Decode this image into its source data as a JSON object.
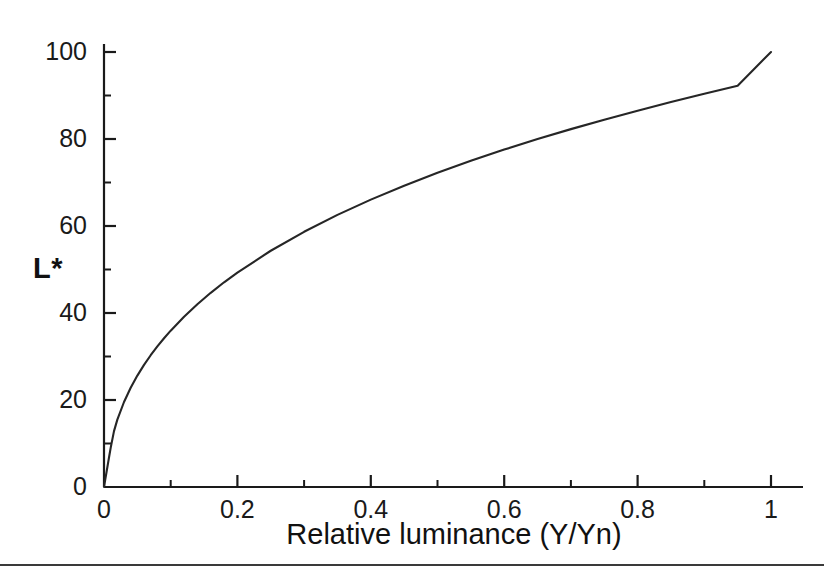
{
  "figure": {
    "background_color": "#ffffff",
    "line_color": "#262626",
    "axis_color": "#1a1a1a",
    "rule_color": "#3a3a3a"
  },
  "chart_data": {
    "type": "line",
    "title": "",
    "subtitle": "",
    "xlabel": "Relative luminance (Y/Yn)",
    "ylabel": "L*",
    "xlim": [
      0,
      1.06
    ],
    "ylim": [
      0,
      103
    ],
    "grid": false,
    "legend": null,
    "x_major_ticks": [
      0,
      0.2,
      0.4,
      0.6,
      0.8,
      1
    ],
    "x_major_tick_labels": [
      "0",
      "0.2",
      "0.4",
      "0.6",
      "0.8",
      "1"
    ],
    "x_minor_ticks": [
      0.1,
      0.3,
      0.5,
      0.7,
      0.9
    ],
    "y_major_ticks": [
      0,
      20,
      40,
      60,
      80,
      100
    ],
    "y_major_tick_labels": [
      "0",
      "20",
      "40",
      "60",
      "80",
      "100"
    ],
    "y_minor_ticks": [
      10,
      30,
      50,
      70,
      90
    ],
    "series": [
      {
        "name": "CIE lightness L*",
        "x": [
          0,
          0.002,
          0.004,
          0.006,
          0.008008,
          0.01,
          0.015,
          0.02,
          0.03,
          0.04,
          0.05,
          0.06,
          0.07,
          0.08,
          0.09,
          0.1,
          0.12,
          0.14,
          0.16,
          0.18,
          0.2,
          0.25,
          0.3,
          0.35,
          0.4,
          0.45,
          0.5,
          0.55,
          0.6,
          0.65,
          0.7,
          0.75,
          0.8,
          0.85,
          0.9,
          0.95,
          1
        ],
        "y": [
          0,
          1.81,
          3.61,
          5.42,
          7.23,
          8.99,
          12.84,
          15.49,
          19.54,
          22.81,
          25.61,
          28.07,
          30.29,
          32.31,
          34.19,
          35.94,
          39.14,
          42.02,
          44.64,
          47.06,
          49.3,
          54.31,
          58.67,
          62.55,
          66.06,
          69.27,
          72.23,
          74.98,
          77.56,
          79.98,
          82.27,
          84.45,
          86.52,
          88.51,
          90.41,
          92.24,
          100
        ]
      }
    ]
  }
}
